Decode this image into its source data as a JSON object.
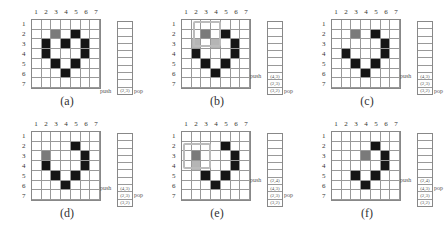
{
  "columns": [
    "1",
    "2",
    "3",
    "4",
    "5",
    "6",
    "7"
  ],
  "rows": [
    "1",
    "2",
    "3",
    "4",
    "5",
    "6",
    "7"
  ],
  "push_label": "push",
  "pop_label": "pop",
  "panels": [
    {
      "caption": "(a)",
      "left": 0,
      "top": 0,
      "gray": [
        [
          2,
          3
        ]
      ],
      "light": [],
      "black": [
        [
          2,
          5
        ],
        [
          3,
          2
        ],
        [
          3,
          4
        ],
        [
          3,
          6
        ],
        [
          4,
          2
        ],
        [
          4,
          6
        ],
        [
          5,
          3
        ],
        [
          5,
          5
        ],
        [
          6,
          4
        ]
      ],
      "stack": [
        "(2,3)"
      ],
      "push_slot": 9,
      "pop_slot": 9,
      "arrows": false
    },
    {
      "caption": "(b)",
      "left": 150,
      "top": 0,
      "gray": [
        [
          2,
          3
        ]
      ],
      "light": [
        [
          3,
          2
        ],
        [
          3,
          4
        ]
      ],
      "black": [
        [
          2,
          5
        ],
        [
          3,
          6
        ],
        [
          4,
          2
        ],
        [
          4,
          6
        ],
        [
          5,
          3
        ],
        [
          5,
          5
        ],
        [
          6,
          4
        ]
      ],
      "stack": [
        "(4,3)",
        "(2,3)",
        "(3,2)"
      ],
      "push_slot": 7,
      "pop_slot": 9,
      "arrows": true
    },
    {
      "caption": "(c)",
      "left": 300,
      "top": 0,
      "gray": [
        [
          2,
          3
        ]
      ],
      "light": [],
      "black": [
        [
          2,
          5
        ],
        [
          3,
          6
        ],
        [
          4,
          2
        ],
        [
          4,
          6
        ],
        [
          5,
          3
        ],
        [
          5,
          5
        ],
        [
          6,
          4
        ]
      ],
      "stack": [
        "(4,3)",
        "(2,3)",
        "(3,2)"
      ],
      "push_slot": 7,
      "pop_slot": 9,
      "arrows": false
    },
    {
      "caption": "(d)",
      "left": 0,
      "top": 112,
      "gray": [
        [
          3,
          2
        ]
      ],
      "light": [],
      "black": [
        [
          2,
          5
        ],
        [
          3,
          6
        ],
        [
          4,
          2
        ],
        [
          4,
          6
        ],
        [
          5,
          3
        ],
        [
          5,
          5
        ],
        [
          6,
          4
        ]
      ],
      "stack": [
        "(4,3)",
        "(2,3)",
        "(3,2)"
      ],
      "push_slot": 7,
      "pop_slot": 8,
      "arrows": false
    },
    {
      "caption": "(e)",
      "left": 150,
      "top": 112,
      "gray": [
        [
          3,
          2
        ]
      ],
      "light": [
        [
          4,
          2
        ]
      ],
      "black": [
        [
          2,
          5
        ],
        [
          3,
          6
        ],
        [
          4,
          6
        ],
        [
          5,
          3
        ],
        [
          5,
          5
        ],
        [
          6,
          4
        ]
      ],
      "stack": [
        "(2,4)",
        "(4,3)",
        "(2,3)",
        "(3,2)"
      ],
      "push_slot": 6,
      "pop_slot": 8,
      "arrows": true
    },
    {
      "caption": "(f)",
      "left": 300,
      "top": 112,
      "gray": [
        [
          3,
          4
        ]
      ],
      "light": [],
      "black": [
        [
          2,
          5
        ],
        [
          3,
          6
        ],
        [
          4,
          6
        ],
        [
          5,
          3
        ],
        [
          5,
          5
        ],
        [
          6,
          4
        ]
      ],
      "stack": [
        "(2,4)",
        "(4,3)",
        "(2,3)",
        "(3,2)"
      ],
      "push_slot": 6,
      "pop_slot": 7,
      "arrows": false
    }
  ]
}
